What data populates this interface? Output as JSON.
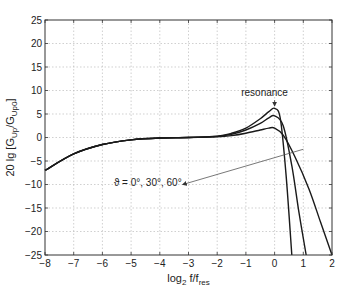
{
  "chart_data": {
    "type": "line",
    "title": "",
    "xlabel": "log2 f/fres",
    "xlabel_parts": {
      "main": "log",
      "sub1": "2",
      "mid": " f/f",
      "sub2": "res"
    },
    "ylabel": "20 lg [G_Up/G_Up0]",
    "ylabel_parts": {
      "main": "20 lg [G",
      "sub1": "Up",
      "mid": "/G",
      "sub2": "Up0",
      "end": "]"
    },
    "xlim": [
      -8,
      2
    ],
    "ylim": [
      -25,
      25
    ],
    "xticks": [
      -8,
      -7,
      -6,
      -5,
      -4,
      -3,
      -2,
      -1,
      0,
      1,
      2
    ],
    "yticks": [
      -25,
      -20,
      -15,
      -10,
      -5,
      0,
      5,
      10,
      15,
      20,
      25
    ],
    "grid": true,
    "grid_style": "dotted",
    "series": [
      {
        "name": "θ = 0°",
        "x": [
          -8,
          -7,
          -6,
          -5,
          -4,
          -3,
          -2,
          -1.5,
          -1,
          -0.5,
          -0.2,
          0,
          0.2,
          0.4,
          0.6
        ],
        "y": [
          -7,
          -3.5,
          -1.5,
          -0.5,
          -0.1,
          0,
          0.3,
          0.9,
          2,
          4,
          5.5,
          6.2,
          4,
          -8,
          -25
        ]
      },
      {
        "name": "θ = 30°",
        "x": [
          -8,
          -7,
          -6,
          -5,
          -4,
          -3,
          -2,
          -1.5,
          -1,
          -0.5,
          -0.2,
          0,
          0.3,
          0.6,
          0.85,
          1.1
        ],
        "y": [
          -7,
          -3.5,
          -1.5,
          -0.5,
          -0.1,
          0,
          0.25,
          0.7,
          1.6,
          3,
          4.2,
          4.6,
          2.5,
          -6,
          -16,
          -25
        ]
      },
      {
        "name": "θ = 60°",
        "x": [
          -8,
          -7,
          -6,
          -5,
          -4,
          -3,
          -2,
          -1.5,
          -1,
          -0.5,
          -0.2,
          0,
          0.3,
          0.7,
          1.2,
          1.6,
          2
        ],
        "y": [
          -7,
          -3.5,
          -1.5,
          -0.5,
          -0.1,
          0,
          0.15,
          0.4,
          0.9,
          1.6,
          2,
          2,
          0.5,
          -4,
          -11,
          -18,
          -25
        ]
      }
    ],
    "annotations": [
      {
        "text": "resonance",
        "x": -0.35,
        "y": 8.8,
        "arrow_to": [
          0,
          6.3
        ]
      },
      {
        "text": "ϑ = 0°, 30°, 60°",
        "x": -5.6,
        "y": -10.3,
        "arrow_from": [
          1.0,
          -2.5
        ],
        "arrow_to": [
          -3.2,
          -10.0
        ]
      }
    ],
    "line_color": "#1a1a1a"
  }
}
